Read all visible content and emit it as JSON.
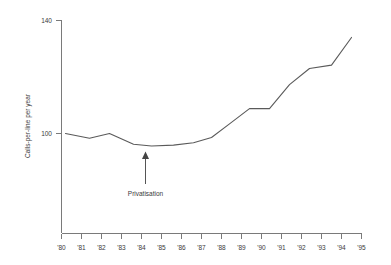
{
  "chart_data": {
    "type": "line",
    "title": "",
    "xlabel": "",
    "ylabel": "Calls-per-line per year",
    "ylim": [
      60,
      140
    ],
    "xlim": [
      1980,
      1995
    ],
    "grid": false,
    "legend": null,
    "y_ticks": [
      {
        "value": 100,
        "label": "100"
      },
      {
        "value": 140,
        "label": "140"
      }
    ],
    "x_ticks": [
      {
        "value": 1980,
        "label": "'80"
      },
      {
        "value": 1981,
        "label": "'81"
      },
      {
        "value": 1982,
        "label": "'82"
      },
      {
        "value": 1983,
        "label": "'83"
      },
      {
        "value": 1984,
        "label": "'84"
      },
      {
        "value": 1985,
        "label": "'85"
      },
      {
        "value": 1986,
        "label": "'86"
      },
      {
        "value": 1987,
        "label": "'87"
      },
      {
        "value": 1988,
        "label": "'88"
      },
      {
        "value": 1989,
        "label": "'89"
      },
      {
        "value": 1990,
        "label": "'90"
      },
      {
        "value": 1991,
        "label": "'91"
      },
      {
        "value": 1992,
        "label": "'92"
      },
      {
        "value": 1993,
        "label": "'93"
      },
      {
        "value": 1994,
        "label": "'94"
      },
      {
        "value": 1995,
        "label": "'95"
      }
    ],
    "x": [
      1980.2,
      1981.4,
      1982.4,
      1983.6,
      1984.5,
      1985.6,
      1986.6,
      1987.5,
      1988.4,
      1989.4,
      1990.4,
      1991.4,
      1992.4,
      1993.5,
      1994.5
    ],
    "values": [
      100.0,
      98.3,
      100.0,
      96.2,
      95.6,
      95.9,
      96.7,
      98.6,
      103.4,
      108.8,
      108.8,
      117.3,
      123.0,
      124.2,
      134.0
    ],
    "series": [
      {
        "name": "Calls-per-line per year",
        "values": [
          100.0,
          98.3,
          100.0,
          96.2,
          95.6,
          95.9,
          96.7,
          98.6,
          103.4,
          108.8,
          108.8,
          117.3,
          123.0,
          124.2,
          134.0
        ]
      }
    ],
    "annotations": [
      {
        "label": "Privatisation",
        "x": 1984.0,
        "y": 95.6,
        "arrow": "up"
      }
    ],
    "colors": {
      "line": "#5a5a5a",
      "axis": "#7a7a7a",
      "text": "#3a3a3a",
      "background": "#ffffff"
    }
  }
}
